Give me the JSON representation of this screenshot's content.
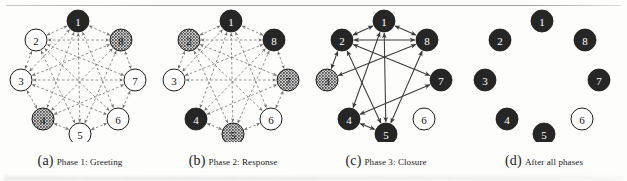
{
  "figure": {
    "type": "diagram",
    "panel_count": 4,
    "node_ids": [
      "1",
      "2",
      "3",
      "4",
      "5",
      "6",
      "7",
      "8"
    ],
    "node_states": {
      "black": "black-filled",
      "white": "white-outline",
      "hatch": "stippled-hatched"
    },
    "edge_styles": {
      "dashed": "dashed-arrow",
      "solid": "solid-arrow"
    },
    "colors": {
      "black_node_fill": "#262626",
      "white_node_fill": "#ffffff",
      "node_stroke": "#1c1c1c",
      "hatch_base": "#cfcfcf",
      "edge_dashed": "#6e6e6e",
      "edge_solid": "#3a3a3a",
      "page_background": "#fdfdfc",
      "rule_color": "#8d8d8d"
    },
    "layout": {
      "node_radius": 11,
      "ring_cx": 74,
      "ring_cy": 68,
      "ring_rx": 55,
      "ring_ry": 55
    }
  },
  "panels": [
    {
      "key": "a",
      "letter": "(a)",
      "caption": "Phase 1: Greeting",
      "edge_style": "dashed",
      "nodes": [
        {
          "id": "1",
          "label": "1",
          "state": "black",
          "x": 74,
          "y": 15
        },
        {
          "id": "2",
          "label": "2",
          "state": "white",
          "x": 32,
          "y": 34
        },
        {
          "id": "3",
          "label": "3",
          "state": "white",
          "x": 17,
          "y": 74
        },
        {
          "id": "4",
          "label": "4",
          "state": "hatch",
          "x": 39,
          "y": 113
        },
        {
          "id": "5",
          "label": "5",
          "state": "white",
          "x": 76,
          "y": 128
        },
        {
          "id": "6",
          "label": "6",
          "state": "white",
          "x": 114,
          "y": 113
        },
        {
          "id": "7",
          "label": "7",
          "state": "white",
          "x": 131,
          "y": 74
        },
        {
          "id": "8",
          "label": "8",
          "state": "hatch",
          "x": 117,
          "y": 34
        }
      ],
      "edges": [
        {
          "from": "2",
          "to": "8",
          "arrows": "both"
        },
        {
          "from": "3",
          "to": "7",
          "arrows": "both"
        },
        {
          "from": "2",
          "to": "1",
          "arrows": "both"
        },
        {
          "from": "8",
          "to": "1",
          "arrows": "both"
        },
        {
          "from": "2",
          "to": "3",
          "arrows": "both"
        },
        {
          "from": "7",
          "to": "8",
          "arrows": "both"
        },
        {
          "from": "3",
          "to": "4",
          "arrows": "both"
        },
        {
          "from": "6",
          "to": "7",
          "arrows": "both"
        },
        {
          "from": "4",
          "to": "5",
          "arrows": "both"
        },
        {
          "from": "5",
          "to": "6",
          "arrows": "both"
        },
        {
          "from": "1",
          "to": "4",
          "arrows": "both"
        },
        {
          "from": "1",
          "to": "5",
          "arrows": "both"
        },
        {
          "from": "1",
          "to": "6",
          "arrows": "both"
        },
        {
          "from": "2",
          "to": "5",
          "arrows": "both"
        },
        {
          "from": "2",
          "to": "6",
          "arrows": "both"
        },
        {
          "from": "2",
          "to": "7",
          "arrows": "both"
        },
        {
          "from": "3",
          "to": "6",
          "arrows": "both"
        },
        {
          "from": "3",
          "to": "8",
          "arrows": "both"
        },
        {
          "from": "4",
          "to": "7",
          "arrows": "both"
        },
        {
          "from": "4",
          "to": "8",
          "arrows": "both"
        },
        {
          "from": "5",
          "to": "8",
          "arrows": "both"
        },
        {
          "from": "1",
          "to": "3",
          "arrows": "both"
        }
      ]
    },
    {
      "key": "b",
      "letter": "(b)",
      "caption": "Phase 2: Response",
      "edge_style": "dashed",
      "nodes": [
        {
          "id": "1",
          "label": "1",
          "state": "black",
          "x": 74,
          "y": 15
        },
        {
          "id": "2",
          "label": "2",
          "state": "hatch",
          "x": 32,
          "y": 34
        },
        {
          "id": "3",
          "label": "3",
          "state": "white",
          "x": 17,
          "y": 74
        },
        {
          "id": "4",
          "label": "4",
          "state": "black",
          "x": 39,
          "y": 113
        },
        {
          "id": "5",
          "label": "5",
          "state": "hatch",
          "x": 76,
          "y": 128
        },
        {
          "id": "6",
          "label": "6",
          "state": "white",
          "x": 114,
          "y": 113
        },
        {
          "id": "7",
          "label": "7",
          "state": "hatch",
          "x": 131,
          "y": 74
        },
        {
          "id": "8",
          "label": "8",
          "state": "black",
          "x": 117,
          "y": 34
        }
      ],
      "edges": [
        {
          "from": "2",
          "to": "8",
          "arrows": "both"
        },
        {
          "from": "3",
          "to": "7",
          "arrows": "both"
        },
        {
          "from": "2",
          "to": "1",
          "arrows": "both"
        },
        {
          "from": "8",
          "to": "1",
          "arrows": "both"
        },
        {
          "from": "2",
          "to": "3",
          "arrows": "both"
        },
        {
          "from": "7",
          "to": "8",
          "arrows": "both"
        },
        {
          "from": "6",
          "to": "7",
          "arrows": "both"
        },
        {
          "from": "4",
          "to": "5",
          "arrows": "both"
        },
        {
          "from": "5",
          "to": "6",
          "arrows": "both"
        },
        {
          "from": "1",
          "to": "4",
          "arrows": "both"
        },
        {
          "from": "1",
          "to": "5",
          "arrows": "both"
        },
        {
          "from": "1",
          "to": "6",
          "arrows": "both"
        },
        {
          "from": "2",
          "to": "5",
          "arrows": "both"
        },
        {
          "from": "2",
          "to": "6",
          "arrows": "both"
        },
        {
          "from": "2",
          "to": "7",
          "arrows": "both"
        },
        {
          "from": "3",
          "to": "8",
          "arrows": "both"
        },
        {
          "from": "4",
          "to": "7",
          "arrows": "both"
        },
        {
          "from": "4",
          "to": "8",
          "arrows": "both"
        },
        {
          "from": "5",
          "to": "8",
          "arrows": "both"
        },
        {
          "from": "1",
          "to": "3",
          "arrows": "both"
        }
      ]
    },
    {
      "key": "c",
      "letter": "(c)",
      "caption": "Phase 3: Closure",
      "edge_style": "solid",
      "nodes": [
        {
          "id": "1",
          "label": "1",
          "state": "black",
          "x": 74,
          "y": 15
        },
        {
          "id": "2",
          "label": "2",
          "state": "black",
          "x": 32,
          "y": 34
        },
        {
          "id": "3",
          "label": "3",
          "state": "hatch",
          "x": 17,
          "y": 74
        },
        {
          "id": "4",
          "label": "4",
          "state": "black",
          "x": 39,
          "y": 113
        },
        {
          "id": "5",
          "label": "5",
          "state": "black",
          "x": 76,
          "y": 128
        },
        {
          "id": "6",
          "label": "6",
          "state": "white",
          "x": 114,
          "y": 113
        },
        {
          "id": "7",
          "label": "7",
          "state": "black",
          "x": 131,
          "y": 74
        },
        {
          "id": "8",
          "label": "8",
          "state": "black",
          "x": 117,
          "y": 34
        }
      ],
      "edges": [
        {
          "from": "2",
          "to": "8",
          "arrows": "both"
        },
        {
          "from": "2",
          "to": "1",
          "arrows": "both"
        },
        {
          "from": "8",
          "to": "1",
          "arrows": "both"
        },
        {
          "from": "2",
          "to": "3",
          "arrows": "both"
        },
        {
          "from": "1",
          "to": "4",
          "arrows": "both"
        },
        {
          "from": "1",
          "to": "5",
          "arrows": "both"
        },
        {
          "from": "3",
          "to": "8",
          "arrows": "both"
        },
        {
          "from": "4",
          "to": "5",
          "arrows": "both"
        },
        {
          "from": "4",
          "to": "7",
          "arrows": "both"
        },
        {
          "from": "5",
          "to": "8",
          "arrows": "both"
        },
        {
          "from": "2",
          "to": "7",
          "arrows": "both"
        },
        {
          "from": "2",
          "to": "5",
          "arrows": "both"
        }
      ]
    },
    {
      "key": "d",
      "letter": "(d)",
      "caption": "After all phases",
      "edge_style": "none",
      "nodes": [
        {
          "id": "1",
          "label": "1",
          "state": "black",
          "x": 74,
          "y": 15
        },
        {
          "id": "2",
          "label": "2",
          "state": "black",
          "x": 32,
          "y": 34
        },
        {
          "id": "3",
          "label": "3",
          "state": "black",
          "x": 17,
          "y": 74
        },
        {
          "id": "4",
          "label": "4",
          "state": "black",
          "x": 39,
          "y": 113
        },
        {
          "id": "5",
          "label": "5",
          "state": "black",
          "x": 76,
          "y": 128
        },
        {
          "id": "6",
          "label": "6",
          "state": "white",
          "x": 114,
          "y": 113
        },
        {
          "id": "7",
          "label": "7",
          "state": "black",
          "x": 131,
          "y": 74
        },
        {
          "id": "8",
          "label": "8",
          "state": "black",
          "x": 117,
          "y": 34
        }
      ],
      "edges": []
    }
  ]
}
